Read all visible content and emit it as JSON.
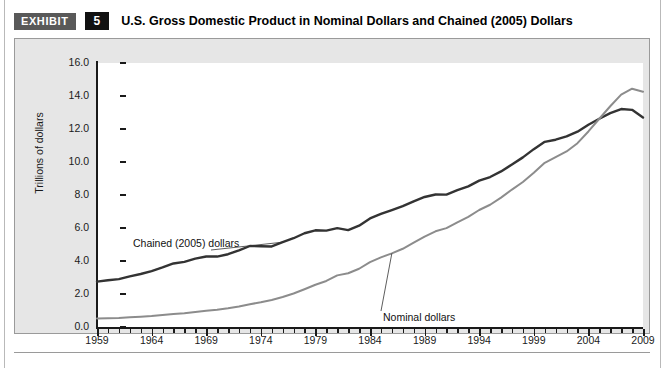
{
  "header": {
    "tag": "EXHIBIT",
    "number": "5",
    "title": "U.S. Gross Domestic Product in Nominal Dollars and Chained (2005) Dollars"
  },
  "colors": {
    "chained_line": "#333333",
    "nominal_line": "#8c8c8c",
    "panel_background": "#e6e6e6",
    "plot_background": "#ffffff",
    "axis": "#1a1a1a",
    "tag_background": "#595959",
    "number_background": "#111111"
  },
  "chart_data": {
    "type": "line",
    "title": "U.S. Gross Domestic Product in Nominal Dollars and Chained (2005) Dollars",
    "xlabel": "",
    "ylabel": "Trillions of dollars",
    "xlim": [
      1959,
      2009
    ],
    "ylim": [
      0.0,
      16.0
    ],
    "grid": false,
    "legend": "inline-annotations",
    "y_ticks": [
      "0.0",
      "2.0",
      "4.0",
      "6.0",
      "8.0",
      "10.0",
      "12.0",
      "14.0",
      "16.0"
    ],
    "x_ticks": [
      "1959",
      "1964",
      "1969",
      "1974",
      "1979",
      "1984",
      "1989",
      "1994",
      "1999",
      "2004",
      "2009"
    ],
    "x_tick_step": 5,
    "x_minor_tick_step": 1,
    "x": [
      1959,
      1960,
      1961,
      1962,
      1963,
      1964,
      1965,
      1966,
      1967,
      1968,
      1969,
      1970,
      1971,
      1972,
      1973,
      1974,
      1975,
      1976,
      1977,
      1978,
      1979,
      1980,
      1981,
      1982,
      1983,
      1984,
      1985,
      1986,
      1987,
      1988,
      1989,
      1990,
      1991,
      1992,
      1993,
      1994,
      1995,
      1996,
      1997,
      1998,
      1999,
      2000,
      2001,
      2002,
      2003,
      2004,
      2005,
      2006,
      2007,
      2008,
      2009
    ],
    "series": [
      {
        "name": "Chained (2005) dollars",
        "color": "#333333",
        "values": [
          2.75,
          2.83,
          2.9,
          3.07,
          3.21,
          3.39,
          3.61,
          3.85,
          3.95,
          4.14,
          4.27,
          4.27,
          4.41,
          4.64,
          4.91,
          4.89,
          4.88,
          5.14,
          5.38,
          5.68,
          5.86,
          5.84,
          5.99,
          5.87,
          6.14,
          6.58,
          6.85,
          7.09,
          7.32,
          7.61,
          7.88,
          8.03,
          8.02,
          8.29,
          8.52,
          8.87,
          9.09,
          9.43,
          9.85,
          10.28,
          10.78,
          11.22,
          11.35,
          11.55,
          11.84,
          12.26,
          12.62,
          12.96,
          13.21,
          13.16,
          12.7
        ],
        "start_value": 2.75,
        "end_value": 12.7,
        "peak_value": 13.21,
        "peak_year": 2007
      },
      {
        "name": "Nominal dollars",
        "color": "#8c8c8c",
        "values": [
          0.51,
          0.53,
          0.55,
          0.59,
          0.62,
          0.66,
          0.72,
          0.79,
          0.83,
          0.91,
          0.98,
          1.04,
          1.13,
          1.24,
          1.38,
          1.5,
          1.64,
          1.82,
          2.03,
          2.29,
          2.56,
          2.79,
          3.13,
          3.26,
          3.53,
          3.93,
          4.22,
          4.46,
          4.74,
          5.11,
          5.48,
          5.8,
          5.99,
          6.34,
          6.67,
          7.09,
          7.41,
          7.84,
          8.33,
          8.79,
          9.35,
          9.95,
          10.29,
          10.64,
          11.14,
          11.85,
          12.62,
          13.38,
          14.08,
          14.44,
          14.26
        ],
        "start_value": 0.51,
        "end_value": 14.26,
        "peak_value": 14.44,
        "peak_year": 2008
      }
    ],
    "annotations": [
      {
        "text": "Chained (2005) dollars",
        "target_year": 1976,
        "target_value": 5.14
      },
      {
        "text": "Nominal dollars",
        "target_year": 1986,
        "target_value": 4.46
      }
    ]
  }
}
